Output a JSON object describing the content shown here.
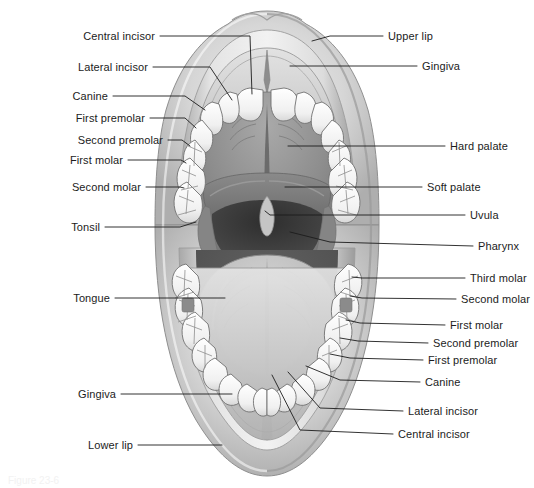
{
  "figure": {
    "caption": "Figure 23-6",
    "background_color": "#ffffff",
    "line_color": "#1c1c1c",
    "text_color": "#1c1c1c"
  },
  "palette": {
    "lip_light": "#d9d9d9",
    "lip_mid": "#bfbfbf",
    "lip_dark": "#a6a6a6",
    "gingiva": "#c8c8c8",
    "hard_palate": "#8f8f8f",
    "soft_palate": "#7a7a7a",
    "pharynx_dark": "#3d3d3d",
    "oral_cavity_dark": "#555555",
    "tongue": "#bdbdbd",
    "tooth_white": "#f4f4f4",
    "tooth_outline": "#6e6e6e"
  },
  "labels_left": [
    {
      "id": "central-incisor-upper",
      "text": "Central incisor",
      "text_x": 155,
      "text_y": 36,
      "line": [
        [
          160,
          36
        ],
        [
          250,
          36
        ],
        [
          252,
          94
        ]
      ]
    },
    {
      "id": "lateral-incisor-upper",
      "text": "Lateral incisor",
      "text_x": 148,
      "text_y": 67,
      "line": [
        [
          153,
          67
        ],
        [
          210,
          67
        ],
        [
          232,
          100
        ]
      ]
    },
    {
      "id": "canine-upper",
      "text": "Canine",
      "text_x": 108,
      "text_y": 96,
      "line": [
        [
          113,
          96
        ],
        [
          185,
          96
        ],
        [
          205,
          110
        ]
      ]
    },
    {
      "id": "first-premolar-upper",
      "text": "First premolar",
      "text_x": 145,
      "text_y": 118,
      "line": [
        [
          150,
          118
        ],
        [
          185,
          118
        ],
        [
          196,
          128
        ]
      ]
    },
    {
      "id": "second-premolar-upper",
      "text": "Second premolar",
      "text_x": 163,
      "text_y": 140,
      "line": [
        [
          168,
          140
        ],
        [
          182,
          140
        ],
        [
          190,
          146
        ]
      ]
    },
    {
      "id": "first-molar-upper",
      "text": "First molar",
      "text_x": 123,
      "text_y": 160,
      "line": [
        [
          128,
          160
        ],
        [
          181,
          160
        ],
        [
          186,
          163
        ]
      ]
    },
    {
      "id": "second-molar-upper",
      "text": "Second molar",
      "text_x": 141,
      "text_y": 187,
      "line": [
        [
          146,
          187
        ],
        [
          180,
          187
        ],
        [
          184,
          188
        ]
      ]
    },
    {
      "id": "tonsil",
      "text": "Tonsil",
      "text_x": 100,
      "text_y": 227,
      "line": [
        [
          105,
          227
        ],
        [
          180,
          227
        ],
        [
          196,
          222
        ]
      ]
    },
    {
      "id": "tongue",
      "text": "Tongue",
      "text_x": 110,
      "text_y": 298,
      "line": [
        [
          115,
          298
        ],
        [
          225,
          298
        ]
      ]
    },
    {
      "id": "gingiva-lower",
      "text": "Gingiva",
      "text_x": 116,
      "text_y": 394,
      "line": [
        [
          121,
          394
        ],
        [
          232,
          394
        ]
      ]
    },
    {
      "id": "lower-lip",
      "text": "Lower lip",
      "text_x": 133,
      "text_y": 445,
      "line": [
        [
          138,
          445
        ],
        [
          222,
          445
        ]
      ]
    }
  ],
  "labels_right": [
    {
      "id": "upper-lip",
      "text": "Upper lip",
      "text_x": 388,
      "text_y": 36,
      "line": [
        [
          383,
          36
        ],
        [
          330,
          36
        ],
        [
          312,
          41
        ]
      ]
    },
    {
      "id": "gingiva-upper",
      "text": "Gingiva",
      "text_x": 422,
      "text_y": 66,
      "line": [
        [
          417,
          66
        ],
        [
          290,
          66
        ]
      ]
    },
    {
      "id": "hard-palate",
      "text": "Hard palate",
      "text_x": 450,
      "text_y": 146,
      "line": [
        [
          445,
          146
        ],
        [
          288,
          146
        ]
      ]
    },
    {
      "id": "soft-palate",
      "text": "Soft palate",
      "text_x": 427,
      "text_y": 187,
      "line": [
        [
          422,
          187
        ],
        [
          285,
          187
        ]
      ]
    },
    {
      "id": "uvula",
      "text": "Uvula",
      "text_x": 470,
      "text_y": 215,
      "line": [
        [
          465,
          215
        ],
        [
          270,
          215
        ],
        [
          265,
          211
        ]
      ]
    },
    {
      "id": "pharynx",
      "text": "Pharynx",
      "text_x": 478,
      "text_y": 246,
      "line": [
        [
          473,
          246
        ],
        [
          330,
          242
        ],
        [
          290,
          232
        ]
      ]
    },
    {
      "id": "third-molar-lower",
      "text": "Third molar",
      "text_x": 470,
      "text_y": 278,
      "line": [
        [
          465,
          278
        ],
        [
          362,
          278
        ],
        [
          352,
          277
        ]
      ]
    },
    {
      "id": "second-molar-lower",
      "text": "Second molar",
      "text_x": 461,
      "text_y": 299,
      "line": [
        [
          456,
          299
        ],
        [
          362,
          298
        ],
        [
          350,
          296
        ]
      ]
    },
    {
      "id": "first-molar-lower",
      "text": "First molar",
      "text_x": 450,
      "text_y": 325,
      "line": [
        [
          445,
          325
        ],
        [
          360,
          323
        ],
        [
          346,
          320
        ]
      ]
    },
    {
      "id": "second-premolar-lower",
      "text": "Second premolar",
      "text_x": 433,
      "text_y": 343,
      "line": [
        [
          428,
          343
        ],
        [
          358,
          341
        ],
        [
          340,
          338
        ]
      ]
    },
    {
      "id": "first-premolar-lower",
      "text": "First premolar",
      "text_x": 428,
      "text_y": 360,
      "line": [
        [
          423,
          360
        ],
        [
          350,
          358
        ],
        [
          330,
          354
        ]
      ]
    },
    {
      "id": "canine-lower",
      "text": "Canine",
      "text_x": 425,
      "text_y": 382,
      "line": [
        [
          420,
          382
        ],
        [
          340,
          380
        ],
        [
          306,
          366
        ]
      ]
    },
    {
      "id": "lateral-incisor-lower",
      "text": "Lateral incisor",
      "text_x": 408,
      "text_y": 411,
      "line": [
        [
          403,
          411
        ],
        [
          320,
          408
        ],
        [
          288,
          372
        ]
      ]
    },
    {
      "id": "central-incisor-lower",
      "text": "Central incisor",
      "text_x": 398,
      "text_y": 434,
      "line": [
        [
          393,
          434
        ],
        [
          300,
          430
        ],
        [
          272,
          375
        ]
      ]
    }
  ],
  "anatomy_parts": [
    {
      "id": "upper-lip-shape",
      "name": "Upper lip"
    },
    {
      "id": "lower-lip-shape",
      "name": "Lower lip"
    },
    {
      "id": "upper-gingiva-shape",
      "name": "Upper gingiva"
    },
    {
      "id": "lower-gingiva-shape",
      "name": "Lower gingiva"
    },
    {
      "id": "hard-palate-shape",
      "name": "Hard palate"
    },
    {
      "id": "soft-palate-shape",
      "name": "Soft palate"
    },
    {
      "id": "uvula-shape",
      "name": "Uvula"
    },
    {
      "id": "pharynx-shape",
      "name": "Pharynx"
    },
    {
      "id": "tonsil-shape",
      "name": "Tonsil"
    },
    {
      "id": "tongue-shape",
      "name": "Tongue"
    },
    {
      "id": "upper-teeth-arch",
      "name": "Upper dental arch"
    },
    {
      "id": "lower-teeth-arch",
      "name": "Lower dental arch"
    }
  ]
}
